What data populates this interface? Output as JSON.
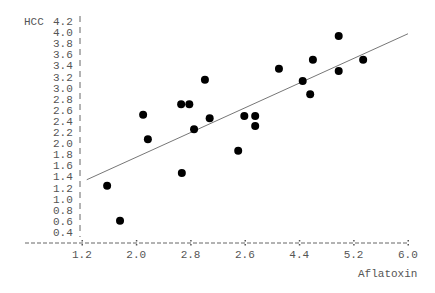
{
  "chart_data": {
    "type": "scatter",
    "title": "",
    "xlabel": "Aflatoxin",
    "ylabel": "HCC",
    "x_tick_labels": [
      "1.2",
      "2.0",
      "2.8",
      "2.6",
      "4.4",
      "5.2",
      "6.0"
    ],
    "y_tick_labels": [
      "4.2",
      "4.0",
      "3.8",
      "3.6",
      "3.4",
      "3.2",
      "3.0",
      "2.8",
      "2.6",
      "2.4",
      "2.2",
      "2.0",
      "1.8",
      "1.6",
      "1.4",
      "1.2",
      "1.0",
      "0.8",
      "0.6",
      "0.4"
    ],
    "xlim": [
      0.6,
      6.0
    ],
    "ylim": [
      0.2,
      4.2
    ],
    "grid": false,
    "legend": null,
    "points": [
      {
        "x": 1.57,
        "y": 1.23
      },
      {
        "x": 1.76,
        "y": 0.6
      },
      {
        "x": 2.1,
        "y": 2.51
      },
      {
        "x": 2.17,
        "y": 2.07
      },
      {
        "x": 2.66,
        "y": 2.7
      },
      {
        "x": 2.78,
        "y": 2.7
      },
      {
        "x": 2.67,
        "y": 1.46
      },
      {
        "x": 2.85,
        "y": 2.25
      },
      {
        "x": 3.01,
        "y": 3.14
      },
      {
        "x": 3.08,
        "y": 2.45
      },
      {
        "x": 3.5,
        "y": 1.86
      },
      {
        "x": 3.59,
        "y": 2.49
      },
      {
        "x": 3.75,
        "y": 2.49
      },
      {
        "x": 3.75,
        "y": 2.31
      },
      {
        "x": 4.1,
        "y": 3.34
      },
      {
        "x": 4.45,
        "y": 3.12
      },
      {
        "x": 4.56,
        "y": 2.88
      },
      {
        "x": 4.6,
        "y": 3.5
      },
      {
        "x": 4.98,
        "y": 3.93
      },
      {
        "x": 4.98,
        "y": 3.3
      },
      {
        "x": 5.34,
        "y": 3.5
      }
    ],
    "regression_line": {
      "x1": 1.27,
      "y1": 1.34,
      "x2": 6.0,
      "y2": 3.97
    },
    "colors": {
      "points": "#000000",
      "line": "#777777",
      "axis": "#555555",
      "text": "#555555"
    }
  }
}
